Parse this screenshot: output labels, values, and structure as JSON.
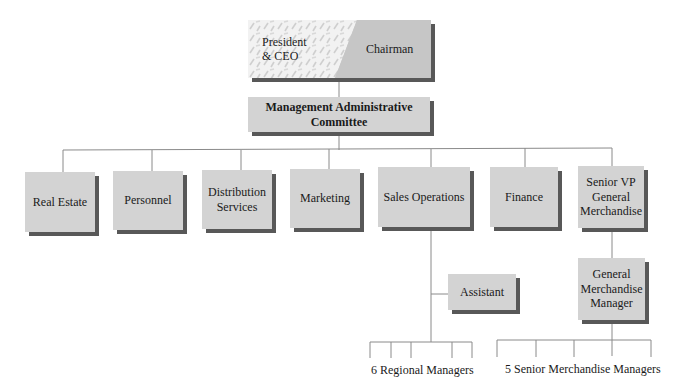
{
  "chart": {
    "top": {
      "left_label": "President\n& CEO",
      "left_line1": "President",
      "left_line2": "& CEO",
      "right_label": "Chairman"
    },
    "committee": {
      "line1": "Management Administrative",
      "line2": "Committee"
    },
    "departments": [
      {
        "label": "Real Estate"
      },
      {
        "label": "Personnel"
      },
      {
        "line1": "Distribution",
        "line2": "Services"
      },
      {
        "label": "Marketing"
      },
      {
        "label": "Sales Operations"
      },
      {
        "label": "Finance"
      },
      {
        "line1": "Senior VP",
        "line2": "General",
        "line3": "Merchandise"
      }
    ],
    "assistant": {
      "label": "Assistant"
    },
    "gmm": {
      "line1": "General",
      "line2": "Merchandise",
      "line3": "Manager"
    },
    "regional_label": "6 Regional Managers",
    "merch_label": "5 Senior Merchandise Managers"
  },
  "colors": {
    "box_fill": "#d3d3d3",
    "shadow": "#585858",
    "line": "#8a8a8a"
  }
}
